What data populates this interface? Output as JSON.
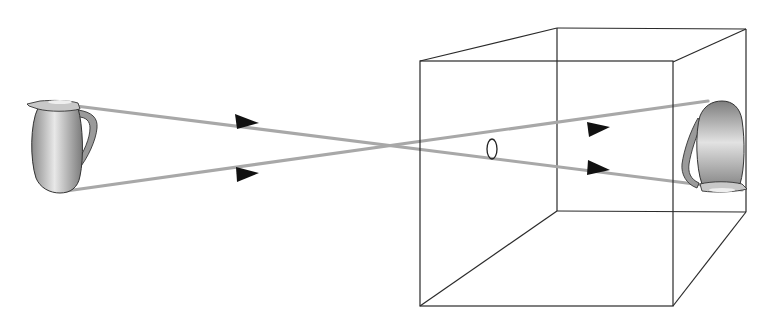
{
  "diagram": {
    "colors": {
      "background": "#ffffff",
      "box_edge": "#2a2a2a",
      "ray": "#a8a8a8",
      "arrow": "#111111",
      "jug_dark": "#6e6e6e",
      "jug_light": "#e6e6e6"
    },
    "object": {
      "name": "pitcher",
      "orientation": "upright",
      "x": 62,
      "y": 148
    },
    "box": {
      "front": {
        "x1": 420,
        "y1": 61,
        "x2": 673,
        "y2": 306
      },
      "back": {
        "x1": 557,
        "y1": 28,
        "x2": 746,
        "y2": 212
      }
    },
    "pinhole": {
      "cx": 492,
      "cy": 149,
      "rx": 5,
      "ry": 10
    },
    "image": {
      "name": "pitcher-image",
      "orientation": "inverted",
      "x": 712,
      "y": 146
    },
    "rays": [
      {
        "from": [
          52,
          103
        ],
        "to": [
          742,
          190
        ],
        "arrows": [
          [
            247,
            122
          ],
          [
            598,
            168
          ]
        ]
      },
      {
        "from": [
          66,
          191
        ],
        "to": [
          708,
          101
        ],
        "arrows": [
          [
            247,
            174
          ],
          [
            598,
            129
          ]
        ]
      }
    ]
  }
}
